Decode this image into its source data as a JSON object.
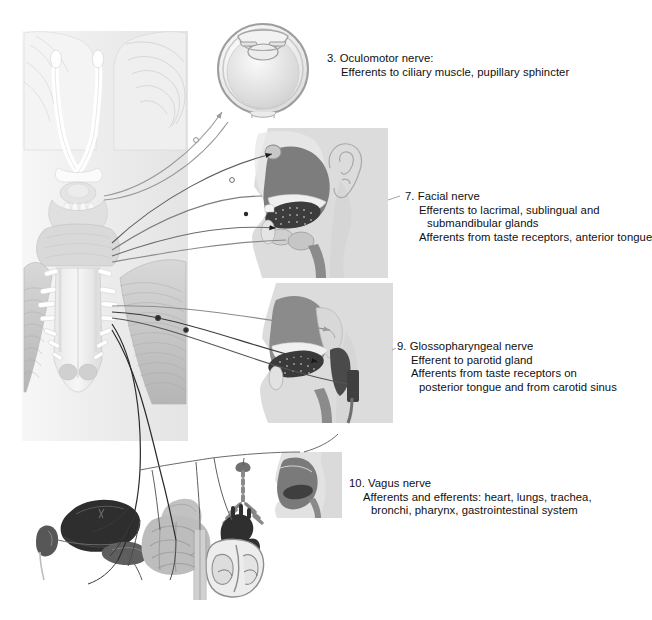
{
  "figure": {
    "background": "#ffffff",
    "width": 647,
    "height": 620
  },
  "labels": [
    {
      "id": "oculomotor",
      "number": "3.",
      "lines": [
        "3. Oculomotor nerve:",
        "Efferents to ciliary muscle, pupillary sphincter"
      ],
      "x": 327,
      "y": 52
    },
    {
      "id": "facial",
      "number": "7.",
      "lines": [
        "7. Facial nerve",
        "Efferents to lacrimal, sublingual and",
        "submandibular glands",
        "Afferents from taste receptors, anterior tongue"
      ],
      "x": 405,
      "y": 190
    },
    {
      "id": "glossopharyngeal",
      "number": "9.",
      "lines": [
        "9. Glossopharyngeal nerve",
        "Efferent to parotid gland",
        "Afferents from taste receptors on",
        "posterior tongue and from carotid sinus"
      ],
      "x": 397,
      "y": 340
    },
    {
      "id": "vagus",
      "number": "10.",
      "lines": [
        "10. Vagus nerve",
        "Afferents and efferents: heart, lungs, trachea,",
        "bronchi, pharynx, gastrointestinal system"
      ],
      "x": 349,
      "y": 477
    }
  ],
  "panels": [
    {
      "id": "brainstem-panel",
      "name": "brainstem-ventral-view",
      "x": 22,
      "y": 31,
      "w": 166,
      "h": 410,
      "fill": "#f2f2f2"
    },
    {
      "id": "eye-panel",
      "name": "eye-cross-section",
      "x": 213,
      "y": 18,
      "w": 100,
      "h": 100,
      "fill": "#ffffff"
    },
    {
      "id": "facial-head",
      "name": "head-sagittal-facial",
      "x": 248,
      "y": 128,
      "w": 140,
      "h": 150,
      "fill": "#dcdcdc"
    },
    {
      "id": "glosso-head",
      "name": "head-sagittal-glosso",
      "x": 258,
      "y": 283,
      "w": 135,
      "h": 140,
      "fill": "#dcdcdc"
    },
    {
      "id": "pharynx-small",
      "name": "pharynx-sagittal-small",
      "x": 272,
      "y": 452,
      "w": 70,
      "h": 66,
      "fill": "#d6d6d6"
    }
  ],
  "organs": [
    {
      "id": "liver",
      "name": "liver",
      "tone": "#2e2e2e"
    },
    {
      "id": "kidney",
      "name": "kidney",
      "tone": "#555555"
    },
    {
      "id": "pancreas",
      "name": "pancreas",
      "tone": "#5e5e5e"
    },
    {
      "id": "intestine",
      "name": "intestines",
      "tone": "#b9b9b9"
    },
    {
      "id": "stomach",
      "name": "stomach",
      "tone": "#c2c2c2"
    },
    {
      "id": "trachea",
      "name": "trachea-bronchi",
      "tone": "#8c8c8c"
    },
    {
      "id": "heart",
      "name": "heart",
      "tone": "#3a3a3a"
    }
  ],
  "colors": {
    "nerve_line": "#1a1a1a",
    "nerve_line_light": "#8f8f8f",
    "panel_gray": "#dcdcdc",
    "tissue_dark": "#6e6e6e",
    "tissue_mid": "#9a9a9a",
    "tissue_light": "#c8c8c8",
    "text": "#101010"
  }
}
